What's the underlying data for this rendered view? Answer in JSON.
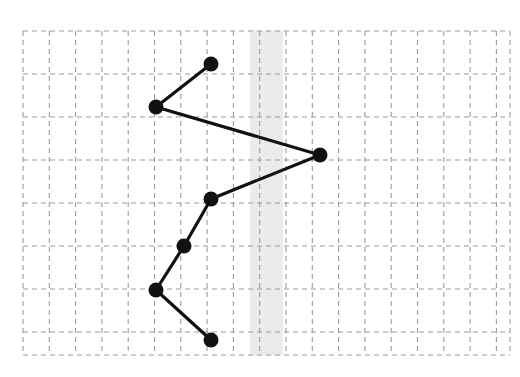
{
  "chart_data": {
    "type": "scatter",
    "title": "",
    "subtitle": "",
    "xlabel": "",
    "ylabel": "",
    "grid": true,
    "legend": false,
    "legend_position": "none",
    "axis_label_position": "top",
    "xlim": [
      1,
      19
    ],
    "ylim": [
      1,
      7
    ],
    "x_tick_labels": [
      "1",
      "2",
      "3",
      "4",
      "5",
      "6",
      "7",
      "8",
      "9",
      "10",
      "11",
      "12",
      "13",
      "14",
      "15",
      "16",
      "17",
      "18",
      "19"
    ],
    "x_ticks": [
      1,
      2,
      3,
      4,
      5,
      6,
      7,
      8,
      9,
      10,
      11,
      12,
      13,
      14,
      15,
      16,
      17,
      18,
      19
    ],
    "y_tick_labels": [],
    "y_ticks": [
      1,
      2,
      3,
      4,
      5,
      6,
      7
    ],
    "series": [
      {
        "name": "series-1",
        "connected": true,
        "marker": "filled-circle",
        "marker_color": "#111111",
        "line_color": "#111111",
        "x": [
          8,
          6,
          12,
          8,
          7,
          6,
          8
        ],
        "y": [
          1,
          2,
          3,
          4,
          5,
          6,
          7
        ],
        "points": [
          {
            "row": 1,
            "x": 8
          },
          {
            "row": 2,
            "x": 6
          },
          {
            "row": 3,
            "x": 12
          },
          {
            "row": 4,
            "x": 8
          },
          {
            "row": 5,
            "x": 7
          },
          {
            "row": 6,
            "x": 6
          },
          {
            "row": 7,
            "x": 8
          }
        ]
      }
    ],
    "highlight_band": {
      "axis": "x",
      "center": 10,
      "from": 9.65,
      "to": 10.95,
      "color": "#ebebeb"
    },
    "colors": {
      "grid": "#9a9a9a",
      "band": "#ebebeb",
      "marker": "#111111",
      "line": "#111111",
      "tick_text": "#3a3a3a",
      "background": "#ffffff"
    }
  },
  "geometry": {
    "grid_left": 23,
    "grid_right": 510,
    "grid_top": 31,
    "grid_bottom": 355,
    "col_step": 26.3,
    "row_step": 43.2,
    "label_baseline_y": 2,
    "marker_radius": 7.5,
    "line_width": 3.2,
    "grid_dash": "5,4",
    "grid_width": 1.1,
    "point_pixels": [
      {
        "cx": 211,
        "cy": 64
      },
      {
        "cx": 156,
        "cy": 107
      },
      {
        "cx": 320,
        "cy": 155
      },
      {
        "cx": 211,
        "cy": 199
      },
      {
        "cx": 184,
        "cy": 246
      },
      {
        "cx": 156,
        "cy": 290
      },
      {
        "cx": 211,
        "cy": 340
      }
    ],
    "v_lines": [
      23,
      49.3,
      75.6,
      101.9,
      128.2,
      154.5,
      180.8,
      207.1,
      233.4,
      259.7,
      286,
      312.3,
      338.6,
      364.9,
      391.2,
      417.5,
      443.8,
      470.1,
      496.4,
      510
    ],
    "h_lines": [
      31,
      74,
      117,
      160,
      203,
      246,
      289,
      332,
      355
    ],
    "band_x": 250,
    "band_width": 33
  }
}
